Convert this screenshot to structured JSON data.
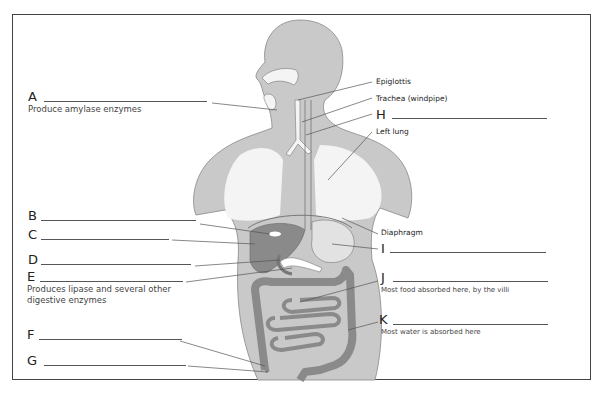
{
  "diagram": {
    "colors": {
      "body_fill": "#c9c9c9",
      "organ_dark": "#8a8a8a",
      "organ_light": "#e2e2e2",
      "lung_fill": "#f2f2f2",
      "line": "#555555",
      "frame": "#444444"
    },
    "fixed_labels": {
      "epiglottis": "Epiglottis",
      "trachea": "Trachea (windpipe)",
      "left_lung": "Left lung",
      "diaphragm": "Diaphragm"
    },
    "blanks": [
      {
        "letter": "A",
        "description": "Produce amylase enzymes",
        "answer": ""
      },
      {
        "letter": "B",
        "description": "",
        "answer": ""
      },
      {
        "letter": "C",
        "description": "",
        "answer": ""
      },
      {
        "letter": "D",
        "description": "",
        "answer": ""
      },
      {
        "letter": "E",
        "description": "Produces lipase and several other",
        "description2": "digestive enzymes",
        "answer": ""
      },
      {
        "letter": "F",
        "description": "",
        "answer": ""
      },
      {
        "letter": "G",
        "description": "",
        "answer": ""
      },
      {
        "letter": "H",
        "description": "",
        "answer": ""
      },
      {
        "letter": "I",
        "description": "",
        "answer": ""
      },
      {
        "letter": "J",
        "description": "Most food absorbed here, by the villi",
        "answer": ""
      },
      {
        "letter": "K",
        "description": "Most water is absorbed here",
        "answer": ""
      }
    ]
  }
}
